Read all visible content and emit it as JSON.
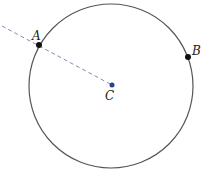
{
  "diagram": {
    "circle": {
      "cx": 111,
      "cy": 86,
      "r": 82,
      "stroke": "#555555"
    },
    "points": [
      {
        "label": "A",
        "x": 39,
        "y": 45,
        "color": "#111111",
        "label_x": 32,
        "label_y": 40
      },
      {
        "label": "B",
        "x": 188,
        "y": 57,
        "color": "#111111",
        "label_x": 192,
        "label_y": 55
      },
      {
        "label": "C",
        "x": 112,
        "y": 85,
        "color": "#2b3f8f",
        "label_x": 105,
        "label_y": 100
      }
    ],
    "dashed_line": {
      "x1": 2,
      "y1": 26,
      "x2": 112,
      "y2": 85,
      "color": "#7b8fb5"
    }
  }
}
